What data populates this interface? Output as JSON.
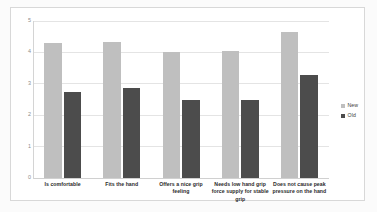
{
  "chart_data": {
    "type": "bar",
    "title": "",
    "xlabel": "",
    "ylabel": "",
    "ylim": [
      0,
      5
    ],
    "yticks": [
      "0",
      "1",
      "2",
      "3",
      "4",
      "5"
    ],
    "grid": true,
    "legend_position": "right",
    "categories": [
      "Is comfortable",
      "Fits the hand",
      "Offers a nice grip feeling",
      "Needs low hand grip force supply for stable grip",
      "Does not cause peak pressure on the hand"
    ],
    "series": [
      {
        "name": "New",
        "color": "#bfbfbf",
        "values": [
          4.3,
          4.33,
          4.0,
          4.03,
          4.65
        ]
      },
      {
        "name": "Old",
        "color": "#4c4c4c",
        "values": [
          2.75,
          2.88,
          2.48,
          2.5,
          3.27
        ]
      }
    ]
  },
  "legend": {
    "entries": [
      {
        "label": "New",
        "swatch": "new"
      },
      {
        "label": "Old",
        "swatch": "old"
      }
    ]
  }
}
